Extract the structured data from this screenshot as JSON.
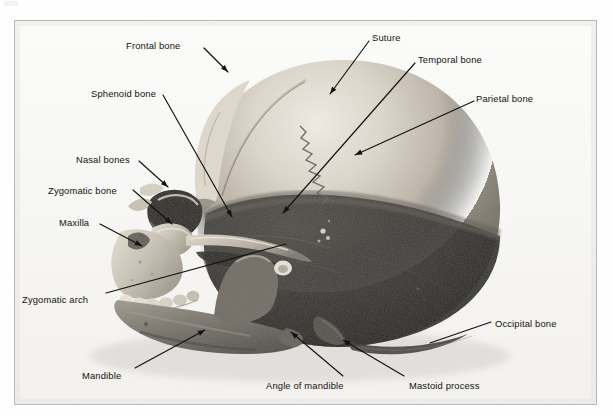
{
  "figure": {
    "kind": "labeled-photograph",
    "view": "left lateral (side) view, facing left",
    "frame": {
      "border_color": "#b9b9b9",
      "background": "#fdfdfd"
    },
    "ink_color": "#14120f",
    "labels": [
      {
        "id": "frontal-bone",
        "text": "Frontal bone",
        "text_x": 126,
        "text_y": 41,
        "anchor": "left",
        "leader": [
          [
            204,
            48
          ],
          [
            228,
            72
          ]
        ],
        "arrowhead": true
      },
      {
        "id": "suture",
        "text": "Suture",
        "text_x": 372,
        "text_y": 33,
        "anchor": "left",
        "leader": [
          [
            369,
            41
          ],
          [
            330,
            94
          ]
        ],
        "arrowhead": true
      },
      {
        "id": "temporal-bone",
        "text": "Temporal bone",
        "text_x": 418,
        "text_y": 55,
        "anchor": "left",
        "leader": [
          [
            415,
            63
          ],
          [
            283,
            213
          ]
        ],
        "arrowhead": true
      },
      {
        "id": "parietal-bone",
        "text": "Parietal bone",
        "text_x": 476,
        "text_y": 94,
        "anchor": "left",
        "leader": [
          [
            474,
            101
          ],
          [
            355,
            155
          ]
        ],
        "arrowhead": true
      },
      {
        "id": "sphenoid-bone",
        "text": "Sphenoid bone",
        "text_x": 91,
        "text_y": 89,
        "anchor": "left",
        "leader": [
          [
            163,
            95
          ],
          [
            232,
            217
          ]
        ],
        "arrowhead": true
      },
      {
        "id": "nasal-bones",
        "text": "Nasal bones",
        "text_x": 76,
        "text_y": 155,
        "anchor": "left",
        "leader": [
          [
            139,
            161
          ],
          [
            168,
            187
          ]
        ],
        "arrowhead": true
      },
      {
        "id": "zygomatic-bone",
        "text": "Zygomatic bone",
        "text_x": 48,
        "text_y": 186,
        "anchor": "left",
        "leader": [
          [
            133,
            190
          ],
          [
            172,
            224
          ]
        ],
        "arrowhead": true
      },
      {
        "id": "maxilla",
        "text": "Maxilla",
        "text_x": 59,
        "text_y": 218,
        "anchor": "left",
        "leader": [
          [
            100,
            224
          ],
          [
            142,
            246
          ]
        ],
        "arrowhead": true
      },
      {
        "id": "zygomatic-arch",
        "text": "Zygomatic arch",
        "text_x": 22,
        "text_y": 295,
        "anchor": "left",
        "leader": [
          [
            106,
            293
          ],
          [
            286,
            244
          ]
        ],
        "arrowhead": false
      },
      {
        "id": "mandible",
        "text": "Mandible",
        "text_x": 82,
        "text_y": 371,
        "anchor": "left",
        "leader": [
          [
            135,
            368
          ],
          [
            205,
            330
          ]
        ],
        "arrowhead": true
      },
      {
        "id": "angle-of-mandible",
        "text": "Angle of mandible",
        "text_x": 266,
        "text_y": 381,
        "anchor": "left",
        "leader": [
          [
            343,
            376
          ],
          [
            291,
            332
          ]
        ],
        "arrowhead": true
      },
      {
        "id": "mastoid-process",
        "text": "Mastoid process",
        "text_x": 409,
        "text_y": 381,
        "anchor": "left",
        "leader": [
          [
            404,
            376
          ],
          [
            343,
            340
          ]
        ],
        "arrowhead": true
      },
      {
        "id": "occipital-bone",
        "text": "Occipital bone",
        "text_x": 495,
        "text_y": 319,
        "anchor": "left",
        "leader": [
          [
            491,
            322
          ],
          [
            430,
            343
          ]
        ],
        "arrowhead": false
      }
    ]
  }
}
